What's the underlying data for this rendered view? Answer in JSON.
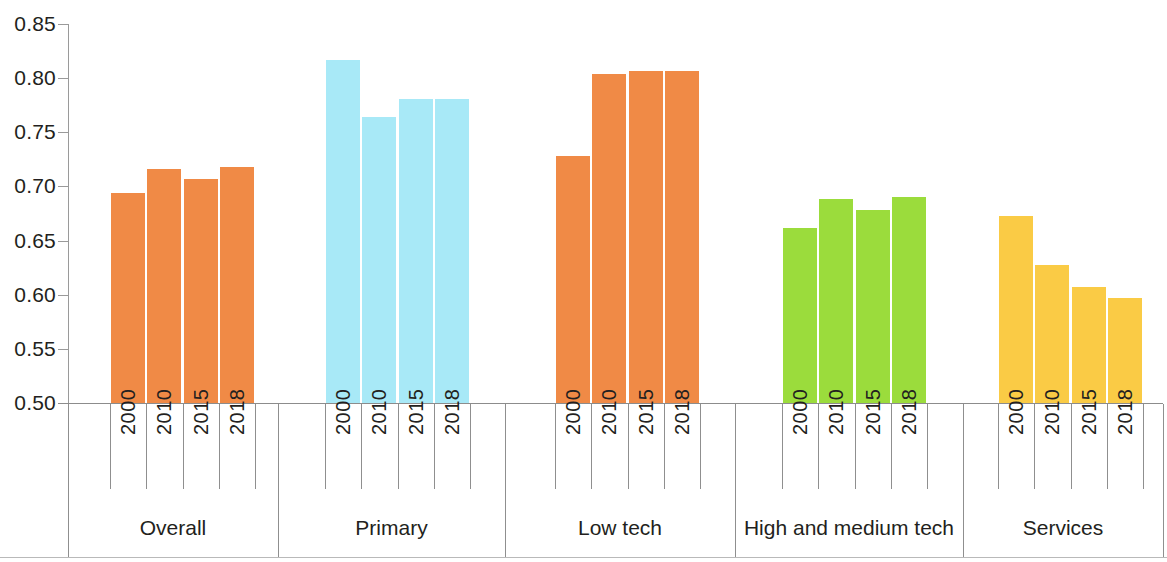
{
  "chart_data": {
    "type": "bar",
    "title": "",
    "subtitle": "",
    "xlabel": "",
    "ylabel": "",
    "ylim": [
      0.5,
      0.85
    ],
    "ytick_step": 0.05,
    "ytick_labels": [
      "0.85",
      "0.80",
      "0.75",
      "0.70",
      "0.65",
      "0.60",
      "0.55",
      "0.50"
    ],
    "ytick_values": [
      0.85,
      0.8,
      0.75,
      0.7,
      0.65,
      0.6,
      0.55,
      0.5
    ],
    "grid": false,
    "legend": "none",
    "categories": [
      "2000",
      "2010",
      "2015",
      "2018"
    ],
    "groups": [
      {
        "name": "Overall",
        "color": "#F08A46",
        "values": [
          0.6935,
          0.716,
          0.7065,
          0.718
        ]
      },
      {
        "name": "Primary",
        "color": "#A8E9F7",
        "values": [
          0.8165,
          0.764,
          0.7805,
          0.781
        ]
      },
      {
        "name": "Low tech",
        "color": "#F08A46",
        "values": [
          0.7285,
          0.804,
          0.8065,
          0.807
        ]
      },
      {
        "name": "High and medium tech",
        "color": "#9BDC3C",
        "values": [
          0.6615,
          0.6885,
          0.6785,
          0.6905
        ]
      },
      {
        "name": "Services",
        "color": "#FACB45",
        "values": [
          0.673,
          0.6275,
          0.6075,
          0.597
        ]
      }
    ]
  },
  "axis": {
    "y_labels": [
      "0.85",
      "0.80",
      "0.75",
      "0.70",
      "0.65",
      "0.60",
      "0.55",
      "0.50"
    ]
  },
  "groups": {
    "overall": {
      "label": "Overall"
    },
    "primary": {
      "label": "Primary"
    },
    "low_tech": {
      "label": "Low tech"
    },
    "high_medium_tech": {
      "label": "High and medium tech"
    },
    "services": {
      "label": "Services"
    }
  },
  "years": [
    "2000",
    "2010",
    "2015",
    "2018"
  ]
}
